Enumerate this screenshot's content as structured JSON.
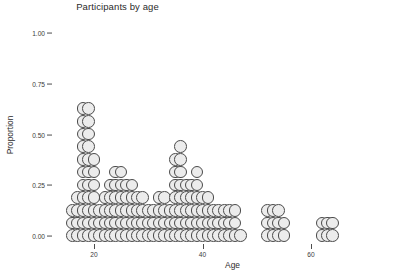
{
  "chart_data": {
    "type": "scatter",
    "plot_style": "dotplot",
    "title": "Participants by age",
    "xlabel": "Age",
    "ylabel": "Proportion",
    "grid": false,
    "legend": null,
    "xlim": [
      13,
      72
    ],
    "ylim": [
      0.0,
      1.0
    ],
    "xticks": [
      20,
      40,
      60
    ],
    "xtick_labels": [
      "20",
      "40",
      "60"
    ],
    "yticks": [
      0.0,
      0.25,
      0.5,
      0.75,
      1.0
    ],
    "ytick_labels": [
      "0.00",
      "0.25",
      "0.50",
      "0.75",
      "1.00"
    ],
    "dot_unit_proportion": 0.0625,
    "dot_diameter_px": 12.7,
    "dot_fill_color": "#ececec",
    "dot_stroke_color": "#4a4a4a",
    "background_color": "#ffffff",
    "x": [
      16,
      17,
      18,
      19,
      20,
      21,
      22,
      23,
      24,
      25,
      26,
      27,
      28,
      29,
      30,
      31,
      32,
      33,
      34,
      35,
      36,
      37,
      38,
      39,
      40,
      41,
      42,
      43,
      44,
      45,
      46,
      47,
      52,
      53,
      54,
      55,
      62,
      63,
      64
    ],
    "counts": [
      3,
      4,
      11,
      11,
      7,
      3,
      4,
      5,
      6,
      6,
      5,
      5,
      4,
      4,
      3,
      3,
      4,
      4,
      3,
      7,
      8,
      5,
      5,
      6,
      4,
      4,
      3,
      3,
      3,
      3,
      3,
      1,
      3,
      3,
      3,
      2,
      2,
      2,
      2
    ],
    "proportions": [
      0.188,
      0.25,
      0.688,
      0.688,
      0.438,
      0.188,
      0.25,
      0.313,
      0.375,
      0.375,
      0.313,
      0.313,
      0.25,
      0.25,
      0.188,
      0.188,
      0.25,
      0.25,
      0.188,
      0.438,
      0.5,
      0.313,
      0.313,
      0.375,
      0.25,
      0.25,
      0.188,
      0.188,
      0.188,
      0.188,
      0.188,
      0.063,
      0.188,
      0.188,
      0.188,
      0.125,
      0.125,
      0.125,
      0.125
    ]
  }
}
